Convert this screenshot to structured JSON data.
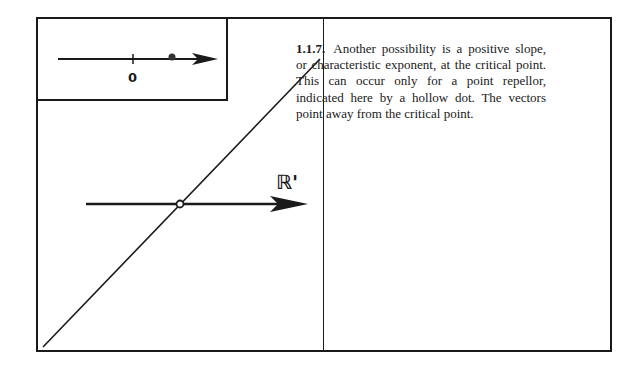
{
  "figure": {
    "number": "1.1.7.",
    "caption_text": "Another possibility is a positive slope, or characteristic exponent, at the critical point. This can occur only for a point repellor, indicated here by a hollow dot. The vectors point away from the critical point.",
    "inset": {
      "origin_label": "0",
      "point_type": "filled-dot"
    },
    "main_plot": {
      "axis_label": "ℝ'",
      "critical_point_type": "hollow-dot",
      "graph": "line with positive slope through critical point"
    }
  },
  "colors": {
    "ink": "#1a1a1a",
    "background": "#ffffff"
  }
}
